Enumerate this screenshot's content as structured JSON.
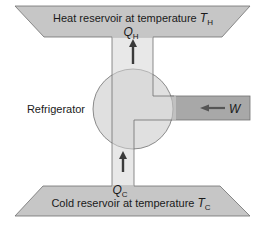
{
  "diagram": {
    "type": "refrigerator energy flow",
    "hot_reservoir": {
      "label": "Heat reservoir at temperature ",
      "symbol": "T",
      "subscript": "H"
    },
    "cold_reservoir": {
      "label": "Cold reservoir at temperature ",
      "symbol": "T",
      "subscript": "C"
    },
    "device_label": "Refrigerator",
    "heat_out": {
      "symbol": "Q",
      "subscript": "H",
      "direction": "up"
    },
    "heat_in": {
      "symbol": "Q",
      "subscript": "C",
      "direction": "up"
    },
    "work_in": {
      "symbol": "W",
      "direction": "left"
    },
    "colors": {
      "reservoir_fill": "#c8c8c8",
      "channel_fill": "#d9d9d9",
      "work_fill": "#a9a9a9",
      "circle_fill": "#dedede",
      "outline": "#6e6e6e",
      "arrow": "#3a3a3a"
    }
  }
}
